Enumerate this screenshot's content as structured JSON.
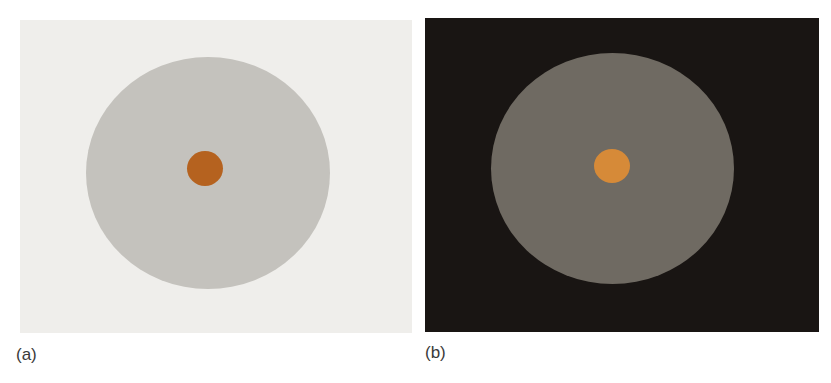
{
  "figure": {
    "panels": [
      {
        "id": "a",
        "label": "(a)",
        "background_color": "#efeeeb",
        "disk_color": "#c4c2bd",
        "center_dot_color": "#b5621f"
      },
      {
        "id": "b",
        "label": "(b)",
        "background_color": "#191513",
        "disk_color": "#6f6a62",
        "center_dot_color": "#d68a38"
      }
    ]
  }
}
